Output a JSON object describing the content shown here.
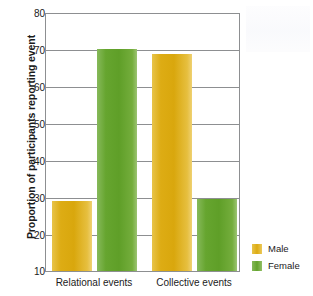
{
  "chart_data": {
    "type": "bar",
    "title": "",
    "xlabel": "",
    "ylabel": "Proportion of participants reporting event",
    "categories": [
      "Relational events",
      "Collective events"
    ],
    "series": [
      {
        "name": "Male",
        "color": "#ddac14",
        "values": [
          29,
          69
        ]
      },
      {
        "name": "Female",
        "color": "#66a52f",
        "values": [
          70.5,
          29.5
        ]
      }
    ],
    "ylim": [
      10,
      80
    ],
    "ytick_step": 10,
    "yticks": [
      "80",
      "70",
      "60",
      "50",
      "40",
      "30",
      "20",
      "10"
    ],
    "ytick_values": [
      80,
      70,
      60,
      50,
      40,
      30,
      20,
      10
    ],
    "grid": "horizontal",
    "legend_position": "right"
  },
  "axis": {
    "y_title": "Proportion of participants reporting event"
  },
  "legend": {
    "entries": [
      {
        "label": "Male",
        "swatch": "male-color-swatch"
      },
      {
        "label": "Female",
        "swatch": "female-color-swatch"
      }
    ]
  },
  "colors": {
    "male": "#ddac14",
    "female": "#66a52f",
    "axis": "#8d8f91",
    "text": "#1b1b1b",
    "background": "#ffffff"
  }
}
